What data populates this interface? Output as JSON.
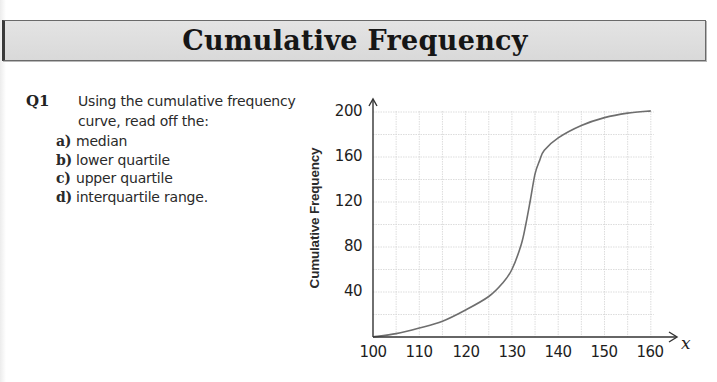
{
  "header": {
    "title": "Cumulative Frequency"
  },
  "question": {
    "number": "Q1",
    "prompt": "Using the cumulative frequency curve, read off the:",
    "parts": [
      {
        "label": "a)",
        "text": "median"
      },
      {
        "label": "b)",
        "text": "lower quartile"
      },
      {
        "label": "c)",
        "text": "upper quartile"
      },
      {
        "label": "d)",
        "text": "interquartile range."
      }
    ]
  },
  "colors": {
    "title_bar": "#dcdcdc",
    "curve": "#6e6e6e",
    "grid": "#d4d4d4",
    "axis": "#333333"
  },
  "chart_data": {
    "type": "line",
    "title": "",
    "xlabel": "x",
    "ylabel": "Cumulative Frequency",
    "xlim": [
      100,
      160
    ],
    "ylim": [
      0,
      200
    ],
    "x_ticks": [
      100,
      110,
      120,
      130,
      140,
      150,
      160
    ],
    "y_ticks": [
      40,
      80,
      120,
      160,
      200
    ],
    "x_tick_labels": [
      "100",
      "110",
      "120",
      "130",
      "140",
      "150",
      "160"
    ],
    "y_tick_labels": [
      "40",
      "80",
      "120",
      "160",
      "200"
    ],
    "grid": true,
    "grid_minor_x": 5,
    "grid_minor_y": 20,
    "legend": null,
    "series": [
      {
        "name": "Cumulative frequency curve",
        "x": [
          100,
          105,
          110,
          115,
          120,
          125,
          128,
          130,
          132,
          133,
          134,
          135,
          136,
          137,
          140,
          145,
          150,
          155,
          160
        ],
        "y": [
          0,
          3,
          8,
          14,
          24,
          36,
          48,
          60,
          82,
          100,
          122,
          145,
          157,
          166,
          177,
          188,
          195,
          199,
          201
        ]
      }
    ]
  }
}
